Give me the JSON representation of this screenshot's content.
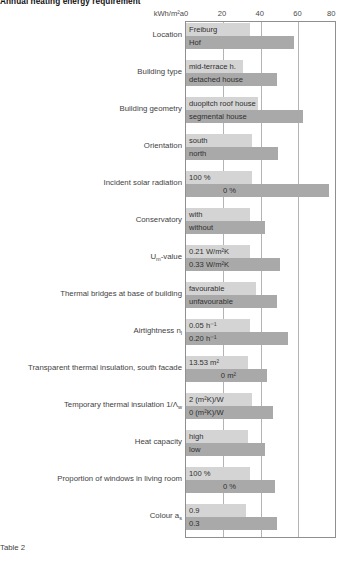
{
  "chart_data": {
    "type": "bar",
    "title": "Annual heating energy requirement",
    "caption": "Table 2",
    "xlabel": "kWh/m²a",
    "ylabel": "",
    "xlim": [
      0,
      80
    ],
    "xticks": [
      0,
      20,
      40,
      60,
      80
    ],
    "grid": true,
    "legend": "none",
    "orientation": "horizontal",
    "series": [
      {
        "name": "variant A (light)",
        "color": "#d4d4d4"
      },
      {
        "name": "variant B (dark)",
        "color": "#a9a9a9"
      }
    ],
    "categories": [
      "Location",
      "Building type",
      "Building geometry",
      "Orientation",
      "Incident solar radiation",
      "Conservatory",
      "Um-value",
      "Thermal bridges at base of building",
      "Airtightness nl",
      "Transparent thermal insulation, south facade",
      "Temporary thermal insulation 1/Λw",
      "Heat capacity",
      "Proportion of windows in living room",
      "Colour as"
    ],
    "rows": [
      {
        "label": "Location",
        "label_html": "Location",
        "upper": {
          "caption": "Freiburg",
          "value": 34,
          "align": "left"
        },
        "lower": {
          "caption": "Hof",
          "value": 57,
          "align": "left"
        }
      },
      {
        "label": "Building type",
        "label_html": "Building type",
        "upper": {
          "caption": "mid-terrace h.",
          "value": 30,
          "align": "left"
        },
        "lower": {
          "caption": "detached house",
          "value": 48,
          "align": "left"
        }
      },
      {
        "label": "Building geometry",
        "label_html": "Building geometry",
        "upper": {
          "caption": "duopitch roof house",
          "value": 38,
          "align": "left"
        },
        "lower": {
          "caption": "segmental house",
          "value": 62,
          "align": "left"
        }
      },
      {
        "label": "Orientation",
        "label_html": "Orientation",
        "upper": {
          "caption": "south",
          "value": 35,
          "align": "left"
        },
        "lower": {
          "caption": "north",
          "value": 49,
          "align": "left"
        }
      },
      {
        "label": "Incident solar radiation",
        "label_html": "Incident solar radiation",
        "upper": {
          "caption": "100 %",
          "value": 35,
          "align": "left"
        },
        "lower": {
          "caption": "0 %",
          "value": 76,
          "align": "right"
        }
      },
      {
        "label": "Conservatory",
        "label_html": "Conservatory",
        "upper": {
          "caption": "with",
          "value": 34,
          "align": "left"
        },
        "lower": {
          "caption": "without",
          "value": 42,
          "align": "left"
        }
      },
      {
        "label": "Um-value",
        "label_html": "U<sub>m</sub>-value",
        "upper": {
          "caption": "0.21 W/m²K",
          "value": 34,
          "align": "left"
        },
        "lower": {
          "caption": "0.33 W/m²K",
          "value": 50,
          "align": "left"
        }
      },
      {
        "label": "Thermal bridges at base of building",
        "label_html": "Thermal bridges at base of building",
        "upper": {
          "caption": "favourable",
          "value": 37,
          "align": "left"
        },
        "lower": {
          "caption": "unfavourable",
          "value": 48,
          "align": "left"
        }
      },
      {
        "label": "Airtightness nl",
        "label_html": "Airtightness n<sub>l</sub>",
        "upper": {
          "caption": "0.05 h⁻¹",
          "value": 34,
          "align": "left"
        },
        "lower": {
          "caption": "0.20 h⁻¹",
          "value": 54,
          "align": "left"
        }
      },
      {
        "label": "Transparent thermal insulation, south facade",
        "label_html": "Transparent thermal insulation, south facade",
        "upper": {
          "caption": "13.53 m²",
          "value": 33,
          "align": "left"
        },
        "lower": {
          "caption": "0 m²",
          "value": 43,
          "align": "right"
        }
      },
      {
        "label": "Temporary thermal insulation 1/Λw",
        "label_html": "Temporary thermal insulation 1/Λ<sub>w</sub>",
        "upper": {
          "caption": "2 (m²K)/W",
          "value": 35,
          "align": "left"
        },
        "lower": {
          "caption": "0 (m²K)/W",
          "value": 46,
          "align": "left"
        }
      },
      {
        "label": "Heat capacity",
        "label_html": "Heat capacity",
        "upper": {
          "caption": "high",
          "value": 33,
          "align": "left"
        },
        "lower": {
          "caption": "low",
          "value": 42,
          "align": "left"
        }
      },
      {
        "label": "Proportion of windows in living room",
        "label_html": "Proportion of windows in living room",
        "upper": {
          "caption": "100 %",
          "value": 34,
          "align": "left"
        },
        "lower": {
          "caption": "0 %",
          "value": 47,
          "align": "right"
        }
      },
      {
        "label": "Colour as",
        "label_html": "Colour a<sub>s</sub>",
        "upper": {
          "caption": "0.9",
          "value": 32,
          "align": "left"
        },
        "lower": {
          "caption": "0.3",
          "value": 48,
          "align": "left"
        }
      }
    ]
  }
}
